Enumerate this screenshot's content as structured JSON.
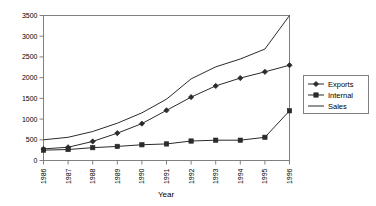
{
  "chart_data": {
    "type": "line",
    "title": "",
    "xlabel": "Year",
    "ylabel": "",
    "categories": [
      "1986",
      "1987",
      "1988",
      "1989",
      "1990",
      "1991",
      "1992",
      "1993",
      "1994",
      "1995",
      "1996"
    ],
    "series": [
      {
        "name": "Exports",
        "marker": "diamond",
        "values": [
          280,
          320,
          460,
          660,
          890,
          1210,
          1530,
          1800,
          1990,
          2140,
          2300
        ]
      },
      {
        "name": "Internal",
        "marker": "square",
        "values": [
          250,
          265,
          310,
          340,
          380,
          400,
          470,
          490,
          490,
          560,
          1200
        ]
      },
      {
        "name": "Sales",
        "marker": "none",
        "values": [
          500,
          560,
          700,
          900,
          1150,
          1480,
          1970,
          2260,
          2450,
          2690,
          3500
        ]
      }
    ],
    "ylim": [
      0,
      3500
    ],
    "ytick_values": [
      0,
      500,
      1000,
      1500,
      2000,
      2500,
      3000,
      3500
    ],
    "ytick_labels": [
      "0",
      "500",
      "1000",
      "1500",
      "2000",
      "2500",
      "3000",
      "3500"
    ],
    "grid": false,
    "legend_position": "right",
    "legend_entries": [
      "Exports",
      "Internal",
      "Sales"
    ],
    "xlabel_rotation": -90
  },
  "colors": {
    "series_line": "#2b2b2b",
    "axis": "#808080",
    "plot_background": "#ffffff",
    "text": "#000000"
  },
  "axis": {
    "x_title": "Year"
  }
}
